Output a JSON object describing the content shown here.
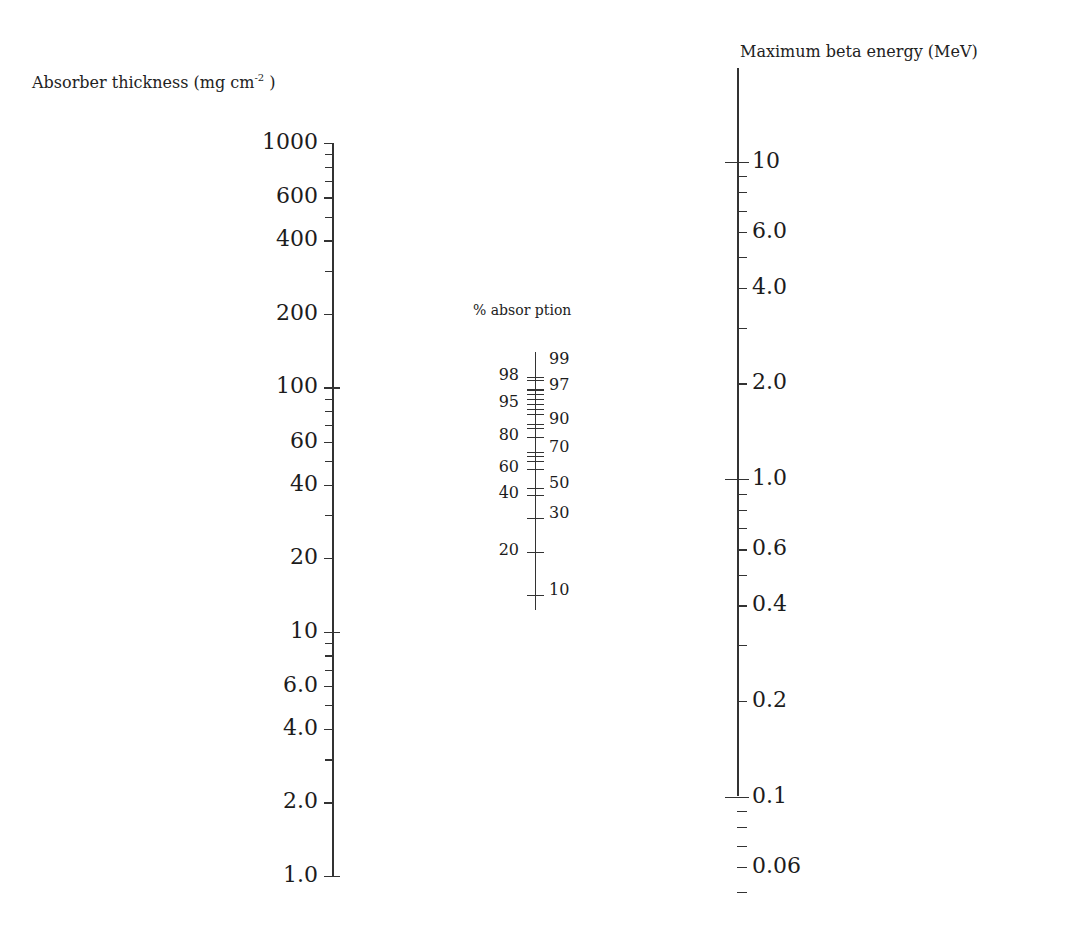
{
  "figure": {
    "left_axis": {
      "title": "Absorber thickness (mg cm",
      "title_sup": "-2",
      "title_close": " )"
    },
    "middle_axis": {
      "title": "% absor ption"
    },
    "right_axis": {
      "title": "Maximum beta energy (MeV)"
    }
  },
  "chart_data": {
    "type": "nomogram",
    "title": "",
    "scales": [
      {
        "name": "Absorber thickness",
        "unit": "mg cm^-2",
        "scale": "log",
        "range": [
          1.0,
          1000
        ],
        "labeled_ticks": [
          "1000",
          "600",
          "400",
          "200",
          "100",
          "60",
          "40",
          "20",
          "10",
          "6.0",
          "4.0",
          "2.0",
          "1.0"
        ],
        "labeled_values": [
          1000,
          600,
          400,
          200,
          100,
          60,
          40,
          20,
          10,
          6,
          4,
          2,
          1
        ],
        "minor_ticks": [
          900,
          800,
          700,
          500,
          300,
          90,
          80,
          70,
          50,
          30,
          9,
          8,
          7,
          5,
          3
        ],
        "cross_ticks": [
          100,
          10,
          1
        ]
      },
      {
        "name": "% absorption",
        "unit": "%",
        "scale": "nonlinear",
        "left_labels": [
          "98",
          "95",
          "80",
          "60",
          "40",
          "20"
        ],
        "left_values": [
          98,
          95,
          80,
          60,
          40,
          20
        ],
        "right_labels": [
          "99",
          "97",
          "90",
          "70",
          "50",
          "30",
          "10"
        ],
        "right_values": [
          99,
          97,
          90,
          70,
          50,
          30,
          10
        ]
      },
      {
        "name": "Maximum beta energy",
        "unit": "MeV",
        "scale": "log",
        "range": [
          0.05,
          10
        ],
        "labeled_ticks": [
          "0.06",
          "0.1",
          "0.2",
          "0.4",
          "0.6",
          "1.0",
          "2.0",
          "4.0",
          "6.0",
          "10"
        ],
        "labeled_values": [
          0.06,
          0.1,
          0.2,
          0.4,
          0.6,
          1.0,
          2.0,
          4.0,
          6.0,
          10
        ],
        "minor_ticks": [
          0.05,
          0.07,
          0.08,
          0.09,
          0.3,
          0.5,
          0.7,
          0.8,
          0.9,
          3,
          5,
          7,
          8,
          9
        ],
        "cross_ticks": [
          0.1,
          1.0,
          10
        ]
      }
    ]
  },
  "layout": {
    "left": {
      "x": 332,
      "y_top": 143,
      "y_bottom": 876,
      "vmax": 1000,
      "vmin": 1
    },
    "right": {
      "x": 737,
      "y_top": 68,
      "y_bottom": 796,
      "y_at_1": 479,
      "px_per_decade": 317.5,
      "vmax": 10
    },
    "middle": {
      "x": 535,
      "y_top": 352,
      "y_bottom": 610,
      "left_ticks_y": {
        "98": 377,
        "95": 404,
        "80": 437,
        "60": 469,
        "40": 495,
        "20": 552
      },
      "right_ticks_y": {
        "99": 359,
        "97": 385,
        "90": 419,
        "70": 447,
        "50": 483,
        "30": 513,
        "10": 590
      },
      "minor_ticks_y": [
        380,
        389,
        394,
        399,
        409,
        414,
        428,
        456,
        461
      ]
    }
  }
}
